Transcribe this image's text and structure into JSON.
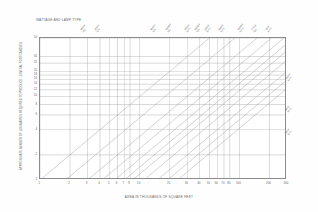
{
  "chart_data": {
    "type": "line",
    "title": "WATTAGE AND LAMP TYPE",
    "xlabel": "AREA IN THOUSANDS OF SQUARE FEET",
    "ylabel": "APPROXIMATE NUMBER OF LUMINAIRES REQUIRED TO PRODUCE 10 INITIAL FOOTCANDLES",
    "xscale": "log",
    "yscale": "log",
    "xlim": [
      1,
      300
    ],
    "ylim": [
      1,
      50
    ],
    "grid": true,
    "legend_position": "diagonal-labels-top-and-right",
    "xticks": [
      1,
      2,
      3,
      4,
      5,
      6,
      7,
      8,
      10,
      20,
      30,
      40,
      50,
      60,
      70,
      80,
      100,
      200,
      300
    ],
    "xticklabels": [
      "1",
      "2",
      "3",
      "4",
      "5",
      "6",
      "7",
      "8",
      "10",
      "20",
      "30",
      "40",
      "50",
      "60",
      "70",
      "80",
      "100",
      "200",
      "300"
    ],
    "yticks": [
      1,
      2,
      4,
      6,
      8,
      10,
      12,
      14,
      16,
      18,
      20,
      25,
      30,
      50
    ],
    "yticklabels": [
      "1",
      "2",
      "4",
      "6",
      "8",
      "10",
      "12",
      "14",
      "16",
      "18",
      "20",
      "25",
      "30",
      "50"
    ],
    "series": [
      {
        "name": "400W MV",
        "slope": 1,
        "intercept_x_at_y1": 1.0,
        "label_x_frac": 0.186,
        "label_lines": [
          "400W",
          "MV"
        ]
      },
      {
        "name": "250W MH",
        "slope": 1,
        "intercept_x_at_y1": 1.8,
        "label_x_frac": 0.242,
        "label_lines": [
          "250W",
          "MH"
        ]
      },
      {
        "name": "400W MH",
        "slope": 1,
        "intercept_x_at_y1": 3.0,
        "label_x_frac": 0.468,
        "label_lines": [
          "400W",
          "MH"
        ]
      },
      {
        "name": "1000W MV",
        "slope": 1,
        "intercept_x_at_y1": 4.2,
        "label_x_frac": 0.53,
        "label_lines": [
          "1000W",
          "MV"
        ]
      },
      {
        "name": "150W HPS",
        "slope": 1,
        "intercept_x_at_y1": 5.6,
        "label_x_frac": 0.608,
        "label_lines": [
          "150W",
          "HPS"
        ]
      },
      {
        "name": "1000W MH",
        "slope": 1,
        "intercept_x_at_y1": 7.0,
        "label_x_frac": 0.648,
        "label_lines": [
          "1000W",
          "MH"
        ]
      },
      {
        "name": "250W HPS",
        "slope": 1,
        "intercept_x_at_y1": 8.5,
        "label_x_frac": 0.69,
        "label_lines": [
          "250W",
          "HPS"
        ]
      },
      {
        "name": "400W HPS",
        "slope": 1,
        "intercept_x_at_y1": 11.0,
        "label_x_frac": 0.745,
        "label_lines": [
          "400W",
          "HPS"
        ]
      },
      {
        "name": "1000W HPS",
        "slope": 1,
        "intercept_x_at_y1": 15.0,
        "label_x_frac": 0.82,
        "label_lines": [
          "1000W",
          "HPS"
        ]
      },
      {
        "name": "175W MV",
        "slope": 1,
        "intercept_x_at_y1": 19.0,
        "label_x_frac": 0.88,
        "label_lines": [
          "175W",
          "MV"
        ]
      },
      {
        "name": "70W HPS",
        "slope": 1,
        "intercept_x_at_y1": 24.0,
        "label_x_frac": 0.935,
        "label_lines": [
          "70W",
          "HPS"
        ]
      }
    ],
    "right_labels": [
      {
        "name": "100W HPS",
        "label_lines": [
          "100W",
          "HPS"
        ],
        "y_frac": 0.28
      },
      {
        "name": "50W HPS",
        "label_lines": [
          "50W",
          "HPS"
        ],
        "y_frac": 0.5
      },
      {
        "name": "35W HPS",
        "label_lines": [
          "35W",
          "HPS"
        ],
        "y_frac": 0.66
      }
    ]
  },
  "colors": {
    "background": "#ffffff",
    "axis": "#8b8b8b",
    "grid": "#a8a8a8",
    "data_line": "#9a9a9a",
    "text": "#666666"
  }
}
